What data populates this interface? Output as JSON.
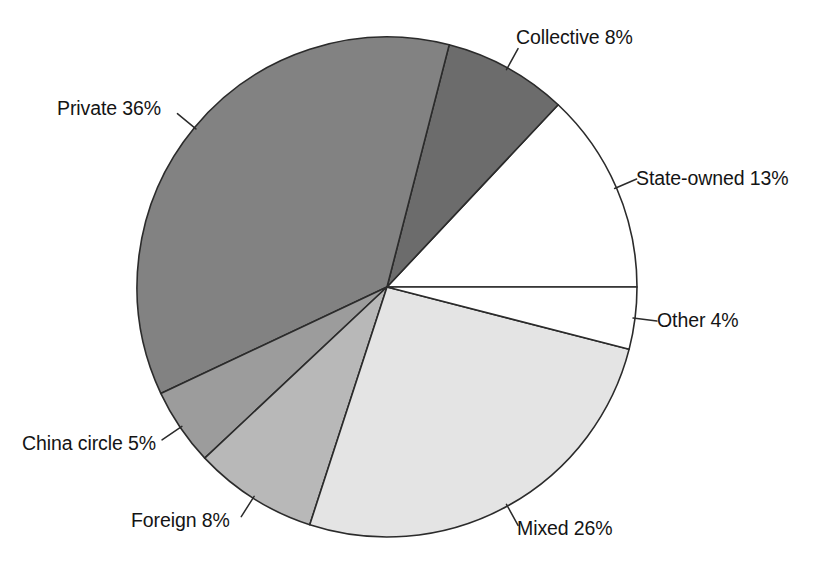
{
  "chart_data": {
    "type": "pie",
    "title": "",
    "subtitle": "",
    "xlabel": "",
    "ylabel": "",
    "legend_position": "none",
    "grid": false,
    "units": "percent",
    "total": 100,
    "labels": [
      "State-owned",
      "Collective",
      "Private",
      "China circle",
      "Foreign",
      "Mixed",
      "Other"
    ],
    "values": [
      13,
      8,
      36,
      5,
      8,
      26,
      4
    ],
    "slices": [
      {
        "id": "state-owned",
        "name": "State-owned",
        "value": 13,
        "percent_text": "13%",
        "label_text": "State-owned 13%",
        "fill": "#ffffff",
        "start_angle_deg": 0,
        "end_angle_deg": 46.8,
        "label_anchor_angle_deg": 23.4
      },
      {
        "id": "collective",
        "name": "Collective",
        "value": 8,
        "percent_text": "8%",
        "label_text": "Collective 8%",
        "fill": "#6c6c6c",
        "start_angle_deg": 46.8,
        "end_angle_deg": 75.6,
        "label_anchor_angle_deg": 61.2
      },
      {
        "id": "private",
        "name": "Private",
        "value": 36,
        "percent_text": "36%",
        "label_text": "Private 36%",
        "fill": "#828282",
        "start_angle_deg": 75.6,
        "end_angle_deg": 205.2,
        "label_anchor_angle_deg": 140.4
      },
      {
        "id": "china-circle",
        "name": "China circle",
        "value": 5,
        "percent_text": "5%",
        "label_text": "China circle 5%",
        "fill": "#9c9c9c",
        "start_angle_deg": 205.2,
        "end_angle_deg": 223.2,
        "label_anchor_angle_deg": 214.2
      },
      {
        "id": "foreign",
        "name": "Foreign",
        "value": 8,
        "percent_text": "8%",
        "label_text": "Foreign 8%",
        "fill": "#b8b8b8",
        "start_angle_deg": 223.2,
        "end_angle_deg": 252.0,
        "label_anchor_angle_deg": 237.6
      },
      {
        "id": "mixed",
        "name": "Mixed",
        "value": 26,
        "percent_text": "26%",
        "label_text": "Mixed 26%",
        "fill": "#e4e4e4",
        "start_angle_deg": 252.0,
        "end_angle_deg": 345.6,
        "label_anchor_angle_deg": 298.8
      },
      {
        "id": "other",
        "name": "Other",
        "value": 4,
        "percent_text": "4%",
        "label_text": "Other 4%",
        "fill": "#ffffff",
        "start_angle_deg": 345.6,
        "end_angle_deg": 360,
        "label_anchor_angle_deg": 352.8
      }
    ],
    "geometry": {
      "center_x": 387,
      "center_y": 287,
      "radius": 250
    },
    "style": {
      "stroke": "#2b2b2b",
      "background": "#ffffff",
      "text_color": "#141414"
    }
  }
}
